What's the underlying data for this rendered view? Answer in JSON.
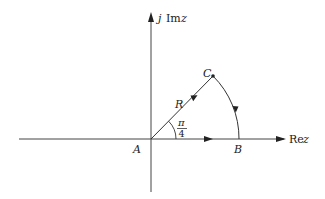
{
  "diagram": {
    "title": "",
    "axes": {
      "real_label_prefix": "Re",
      "real_label_var": "z",
      "imag_label_j": "j",
      "imag_label_prefix": "Im",
      "imag_label_var": "z"
    },
    "points": {
      "A": "A",
      "B": "B",
      "C": "C"
    },
    "radius_label": "R",
    "angle_label": {
      "numerator": "π",
      "denominator": "4"
    },
    "contour": {
      "description": "Closed contour A→B along real axis, B→C along circular arc of radius R, C→A along ray at angle π/4",
      "segments": [
        "A to B (real axis)",
        "B to C (arc, radius R)",
        "C to A (ray at π/4)"
      ]
    },
    "colors": {
      "line": "#333333",
      "text": "#222222",
      "background": "#ffffff"
    }
  }
}
